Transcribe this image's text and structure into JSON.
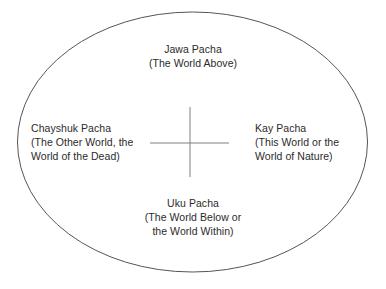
{
  "diagram": {
    "shape": "ellipse",
    "colors": {
      "background": "#ffffff",
      "ellipse_stroke": "#555555",
      "cross_stroke": "#808080",
      "text": "#2b2b2b"
    },
    "ellipse": {
      "center_x": 192.5,
      "center_y": 142,
      "radius_x": 175,
      "radius_y": 130,
      "stroke_width": 1
    },
    "cross": {
      "center_x": 190,
      "center_y": 143,
      "horizontal_x1": 150,
      "horizontal_x2": 229,
      "vertical_y1": 107,
      "vertical_y2": 177,
      "stroke_width": 1
    },
    "labels": {
      "above": {
        "name": "Jawa Pacha",
        "lines": [
          "Jawa Pacha",
          "(The World Above)"
        ]
      },
      "left": {
        "name": "Chayshuk Pacha",
        "lines": [
          "Chayshuk Pacha",
          "(The Other World, the",
          "World of the Dead)"
        ]
      },
      "right": {
        "name": "Kay Pacha",
        "lines": [
          "Kay Pacha",
          "(This World or the",
          "World of Nature)"
        ]
      },
      "below": {
        "name": "Uku Pacha",
        "lines": [
          "Uku Pacha",
          "(The World Below or",
          "the World Within)"
        ]
      }
    }
  }
}
